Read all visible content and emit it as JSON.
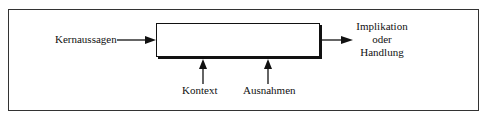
{
  "diagram": {
    "input_label": "Kernaussagen",
    "output_label_lines": [
      "Implikation",
      "oder",
      "Handlung"
    ],
    "context_label": "Kontext",
    "exceptions_label": "Ausnahmen"
  },
  "colors": {
    "line": "#111111",
    "frame": "#333333",
    "background": "#ffffff"
  }
}
